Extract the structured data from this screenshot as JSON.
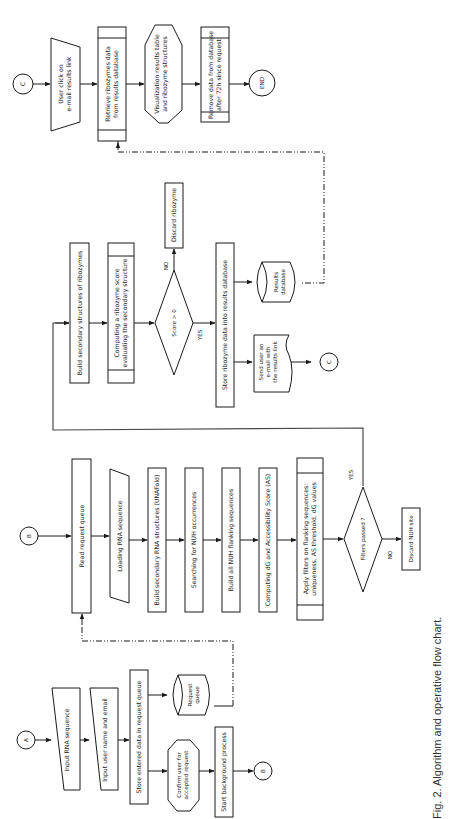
{
  "figure": {
    "caption": "Fig. 2. Algorithm and operative flow chart.",
    "orientation": "rotated 90° counter-clockwise",
    "header_text_cropped": true
  },
  "connectors": {
    "A": "A",
    "B": "B",
    "C": "C",
    "end": "END"
  },
  "input_flow": {
    "input_rna": "Input RNA sequence",
    "input_user": "Input user name and email",
    "store_entered": "Store entered data in request queue",
    "request_queue": [
      "Request",
      "queue"
    ],
    "confirm_user": [
      "Confirm user for",
      "accepted request"
    ],
    "start_background": "Start background process"
  },
  "processing_flow": {
    "read_queue": "Read request queue",
    "loading_rna": "Loading RNA sequence",
    "build_secondary": "Build secondary RNA structures (UNAFold)",
    "search_nuh": "Searching for NUH occurrences",
    "build_flanking": "Build all NUH flanking sequences",
    "computing_dg": "Computing dG and Accessibility Score (AS)",
    "apply_filters": [
      "Apply filters on flanking sequences:",
      "uniqueness, AS threshold, dG values"
    ],
    "filters_decision": "Filters passed ?",
    "yes_label": "YES",
    "no_label": "NO",
    "discard_nuh": "Discard NUH site"
  },
  "ribozyme_flow": {
    "build_ribozymes": "Build secondary structures of ribozymes",
    "computing_score": [
      "Computing a ribozyme score",
      "evaluating the secondary structure"
    ],
    "score_decision": "Score > 0",
    "yes_label": "YES",
    "no_label": "NO",
    "discard_ribozyme": "Discard ribozyme",
    "store_ribozyme": "Store ribozyme data into results database",
    "results_db": [
      "Results",
      "database"
    ],
    "send_email": [
      "Send user an",
      "e-mail with",
      "the results link"
    ]
  },
  "results_flow": {
    "user_click": [
      "User click on",
      "e-mail results link"
    ],
    "retrieve": [
      "Retrieve ribozymes data",
      "from results database"
    ],
    "visualization": [
      "Visualization results table",
      "and ribozyme structures"
    ],
    "remove": [
      "Remove data from database",
      "after 72h since request"
    ]
  }
}
